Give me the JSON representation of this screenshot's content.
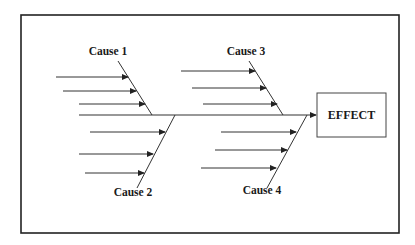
{
  "diagram": {
    "type": "fishbone",
    "effect_label": "EFFECT",
    "causes": [
      {
        "label": "Cause 1",
        "position": "top-left",
        "sub_arrows": 3
      },
      {
        "label": "Cause 2",
        "position": "bottom-left",
        "sub_arrows": 3
      },
      {
        "label": "Cause 3",
        "position": "top-right",
        "sub_arrows": 3
      },
      {
        "label": "Cause 4",
        "position": "bottom-right",
        "sub_arrows": 3
      }
    ],
    "colors": {
      "line": "#222222",
      "background": "#ffffff"
    }
  }
}
